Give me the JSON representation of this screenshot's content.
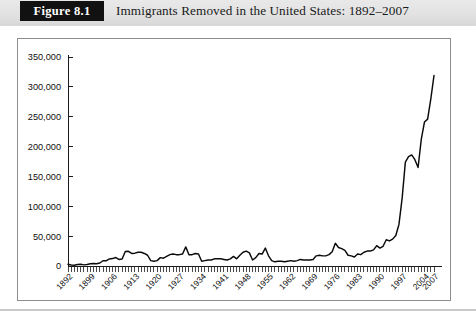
{
  "figure": {
    "number_label": "Figure 8.1",
    "caption": "Immigrants Removed in the United States: 1892–2007"
  },
  "colors": {
    "figure_box_background": "#111111",
    "figure_box_text": "#ffffff",
    "header_band": "#e2e2e2",
    "plot_frame_border": "#8d8d8d",
    "axis": "#1b1b1b",
    "data_line": "#0b0b0b",
    "plot_background": "#ffffff"
  },
  "chart_data": {
    "type": "line",
    "title": "Immigrants Removed in the United States: 1892–2007",
    "xlabel": "",
    "ylabel": "",
    "grid": false,
    "legend": "none",
    "xlim": [
      1892,
      2007
    ],
    "ylim": [
      0,
      350000
    ],
    "ytick_labels": [
      "0",
      "50,000",
      "100,000",
      "150,000",
      "200,000",
      "250,000",
      "300,000",
      "350,000"
    ],
    "ytick_values": [
      0,
      50000,
      100000,
      150000,
      200000,
      250000,
      300000,
      350000
    ],
    "xtick_labels": [
      "1892",
      "1899",
      "1906",
      "1913",
      "1920",
      "1927",
      "1934",
      "1941",
      "1948",
      "1955",
      "1962",
      "1969",
      "1976",
      "1983",
      "1990",
      "1997",
      "2004",
      "2007"
    ],
    "xtick_values": [
      1892,
      1899,
      1906,
      1913,
      1920,
      1927,
      1934,
      1941,
      1948,
      1955,
      1962,
      1969,
      1976,
      1983,
      1990,
      1997,
      2004,
      2007
    ],
    "xtick_rotation_degrees": 45,
    "minor_tick_interval_years": 1,
    "series": [
      {
        "name": "Immigrants removed",
        "x": [
          1892,
          1893,
          1894,
          1895,
          1896,
          1897,
          1898,
          1899,
          1900,
          1901,
          1902,
          1903,
          1904,
          1905,
          1906,
          1907,
          1908,
          1909,
          1910,
          1911,
          1912,
          1913,
          1914,
          1915,
          1916,
          1917,
          1918,
          1919,
          1920,
          1921,
          1922,
          1923,
          1924,
          1925,
          1926,
          1927,
          1928,
          1929,
          1930,
          1931,
          1932,
          1933,
          1934,
          1935,
          1936,
          1937,
          1938,
          1939,
          1940,
          1941,
          1942,
          1943,
          1944,
          1945,
          1946,
          1947,
          1948,
          1949,
          1950,
          1951,
          1952,
          1953,
          1954,
          1955,
          1956,
          1957,
          1958,
          1959,
          1960,
          1961,
          1962,
          1963,
          1964,
          1965,
          1966,
          1967,
          1968,
          1969,
          1970,
          1971,
          1972,
          1973,
          1974,
          1975,
          1976,
          1977,
          1978,
          1979,
          1980,
          1981,
          1982,
          1983,
          1984,
          1985,
          1986,
          1987,
          1988,
          1989,
          1990,
          1991,
          1992,
          1993,
          1994,
          1995,
          1996,
          1997,
          1998,
          1999,
          2000,
          2001,
          2002,
          2003,
          2004,
          2005,
          2006,
          2007
        ],
        "values": [
          2801,
          1630,
          1389,
          2596,
          2799,
          1880,
          2500,
          3798,
          4246,
          3879,
          4974,
          8769,
          8773,
          11879,
          12432,
          14187,
          10900,
          11768,
          24270,
          24650,
          21000,
          21500,
          23000,
          23000,
          21000,
          18000,
          9000,
          8000,
          9000,
          14000,
          13000,
          16000,
          19000,
          20000,
          19000,
          19000,
          20000,
          32000,
          19000,
          19000,
          21000,
          20000,
          8000,
          9000,
          10000,
          10000,
          12000,
          12000,
          12000,
          11000,
          10000,
          12000,
          16000,
          12000,
          18000,
          23000,
          25000,
          22000,
          10000,
          14000,
          21000,
          20000,
          30000,
          17000,
          9000,
          7000,
          8000,
          8000,
          7000,
          8000,
          9000,
          8000,
          9000,
          11000,
          10000,
          10000,
          10000,
          11000,
          17000,
          18000,
          17000,
          17000,
          19000,
          24000,
          38000,
          31000,
          29000,
          26000,
          18000,
          17000,
          15000,
          20000,
          19000,
          23000,
          25000,
          25000,
          27000,
          34000,
          30000,
          33000,
          44000,
          42000,
          45000,
          51000,
          70000,
          114000,
          174000,
          183000,
          186000,
          178000,
          165000,
          212000,
          241000,
          246000,
          280000,
          319000
        ],
        "peak_label": "2007 peak ≈ 319,000"
      }
    ],
    "annotations": []
  }
}
